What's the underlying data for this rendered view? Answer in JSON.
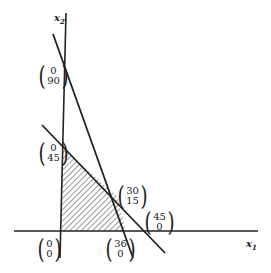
{
  "axes": {
    "x_label": "x",
    "x_sub": "1",
    "y_label": "x",
    "y_sub": "2"
  },
  "points": [
    {
      "id": "p090",
      "top": "0",
      "bottom": "90"
    },
    {
      "id": "p045",
      "top": "0",
      "bottom": "45"
    },
    {
      "id": "p3015",
      "top": "30",
      "bottom": "15"
    },
    {
      "id": "p450",
      "top": "45",
      "bottom": "0"
    },
    {
      "id": "p00",
      "top": "0",
      "bottom": "0"
    },
    {
      "id": "p360",
      "top": "36",
      "bottom": "0"
    }
  ],
  "lines": [
    {
      "name": "constraint-steep",
      "x_intercept": 36,
      "y_intercept": 90
    },
    {
      "name": "constraint-shallow",
      "x_intercept": 45,
      "y_intercept": 45
    }
  ],
  "feasible_region": {
    "vertices": [
      [
        0,
        0
      ],
      [
        0,
        45
      ],
      [
        30,
        15
      ],
      [
        36,
        0
      ]
    ],
    "fill": "hatched"
  }
}
